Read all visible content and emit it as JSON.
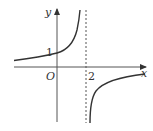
{
  "diagram": {
    "type": "function-graph",
    "axes": {
      "x_label": "x",
      "y_label": "y",
      "origin_label": "O"
    },
    "tick_labels": {
      "y_intercept": "1",
      "asymptote_x": "2"
    },
    "asymptote": {
      "type": "vertical",
      "x": 2,
      "style": "dashed"
    },
    "curves": [
      {
        "name": "left-branch",
        "description": "increasing, passes through (0,1), approaches y=0 from above as x→−∞, rises to +∞ as x→2−"
      },
      {
        "name": "right-branch",
        "description": "increasing, from −∞ as x→2+ approaching y=0 from below as x→+∞"
      }
    ],
    "colors": {
      "stroke": "#333333",
      "background": "#ffffff"
    }
  }
}
